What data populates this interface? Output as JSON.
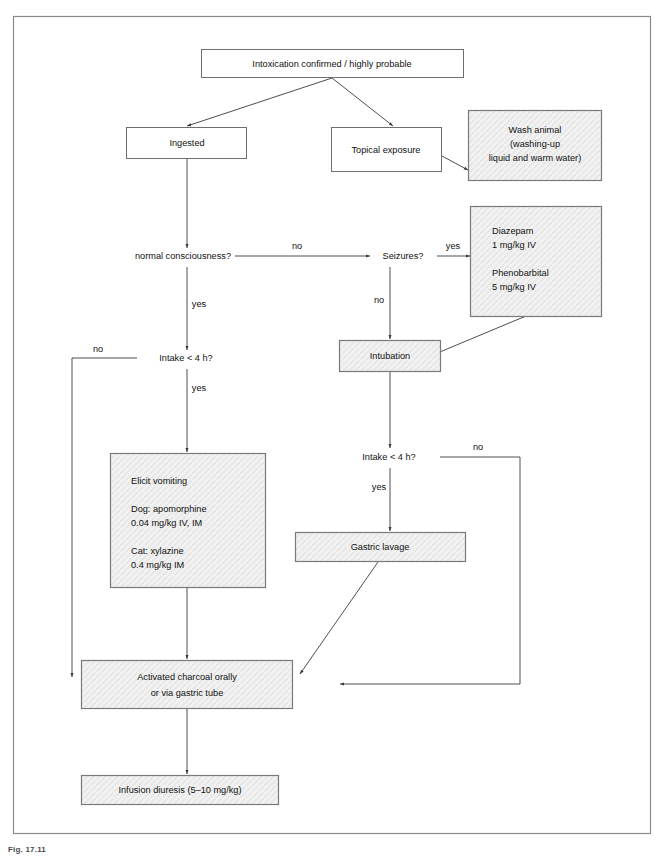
{
  "figure": {
    "caption": "Fig. 17.11",
    "frame_color": "#8a8a8a",
    "shaded_fill": "#f1f1f1",
    "line_color": "#3a3a3a",
    "text_color": "#111111"
  },
  "nodes": {
    "intoxication": {
      "label": "Intoxication confirmed / highly probable",
      "shaded": false
    },
    "ingested": {
      "label": "Ingested",
      "shaded": false
    },
    "topical": {
      "label": "Topical exposure",
      "shaded": false
    },
    "wash": {
      "shaded": true,
      "lines": [
        "Wash animal",
        "(washing-up",
        "liquid and warm water)"
      ]
    },
    "diazepam": {
      "shaded": true,
      "lines": [
        "Diazepam",
        "1 mg/kg IV",
        "",
        "Phenobarbital",
        "5 mg/kg IV"
      ]
    },
    "intubation": {
      "label": "Intubation",
      "shaded": true
    },
    "elicit": {
      "shaded": true,
      "lines": [
        "Elicit vomiting",
        "",
        "Dog: apomorphine",
        "0.04 mg/kg IV, IM",
        "",
        "Cat: xylazine",
        "0.4 mg/kg IM"
      ]
    },
    "lavage": {
      "label": "Gastric lavage",
      "shaded": true
    },
    "charcoal": {
      "shaded": true,
      "lines": [
        "Activated charcoal orally",
        "or via gastric tube"
      ]
    },
    "diuresis": {
      "label": "Infusion diuresis (5–10 mg/kg)",
      "shaded": true
    }
  },
  "decisions": {
    "consciousness": "normal consciousness?",
    "seizures": "Seizures?",
    "intake_left": "Intake < 4 h?",
    "intake_right": "Intake < 4 h?"
  },
  "edge_labels": {
    "consciousness_no": "no",
    "consciousness_yes": "yes",
    "seizures_yes": "yes",
    "seizures_no": "no",
    "intake_left_no": "no",
    "intake_left_yes": "yes",
    "intake_right_no": "no",
    "intake_right_yes": "yes"
  }
}
